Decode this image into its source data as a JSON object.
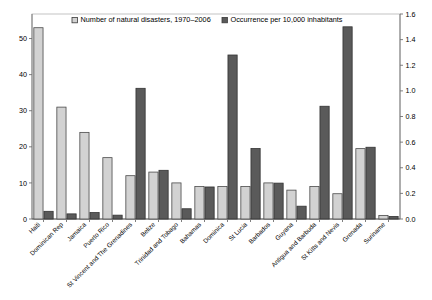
{
  "chart_data": {
    "type": "bar",
    "title": "",
    "xlabel": "",
    "ylabel": "",
    "grid": false,
    "legend_position": "top-inside",
    "categories": [
      "Haiti",
      "Dominican Rep",
      "Jamaica",
      "Puerto Rico",
      "St Vincent and The Grenadines",
      "Belize",
      "Trinidad and Tobago",
      "Bahamas",
      "Dominica",
      "St Lucia",
      "Barbados",
      "Guyana",
      "Antigua and Barbuda",
      "St Kitts and Nevis",
      "Grenada",
      "Suriname"
    ],
    "series": [
      {
        "name": "Number of natural disasters, 1970–2006",
        "axis": "left",
        "color": "#d2d2d2",
        "edge_color": "#4a4a4a",
        "values": [
          53,
          31,
          24,
          17,
          12,
          13,
          10,
          9,
          9,
          9,
          10,
          8,
          9,
          7,
          19.5,
          1
        ]
      },
      {
        "name": "Occurrence per 10,000 inhabitants",
        "axis": "right",
        "color": "#5a5a5a",
        "edge_color": "#333333",
        "values": [
          0.06,
          0.04,
          0.05,
          0.03,
          1.02,
          0.38,
          0.08,
          0.25,
          1.28,
          0.55,
          0.28,
          0.1,
          0.88,
          1.5,
          0.56,
          0.02
        ]
      }
    ],
    "left_axis": {
      "ticks": [
        0,
        10,
        20,
        30,
        40,
        50
      ],
      "tick_labels": [
        "0",
        "10",
        "20",
        "30",
        "40",
        "50"
      ],
      "limits": [
        0,
        56.8
      ]
    },
    "right_axis": {
      "ticks": [
        0.0,
        0.2,
        0.4,
        0.6,
        0.8,
        1.0,
        1.2,
        1.4,
        1.6
      ],
      "tick_labels": [
        "0.0",
        "0.2",
        "0.4",
        "0.6",
        "0.8",
        "1.0",
        "1.2",
        "1.4",
        "1.6"
      ],
      "limits": [
        0,
        1.6
      ]
    },
    "legend": [
      {
        "label": "Number of natural disasters, 1970–2006",
        "marker": "light-square-marker",
        "color": "#d2d2d2"
      },
      {
        "label": "Occurrence per 10,000 inhabitants",
        "marker": "dark-square-marker",
        "color": "#5a5a5a"
      }
    ]
  }
}
